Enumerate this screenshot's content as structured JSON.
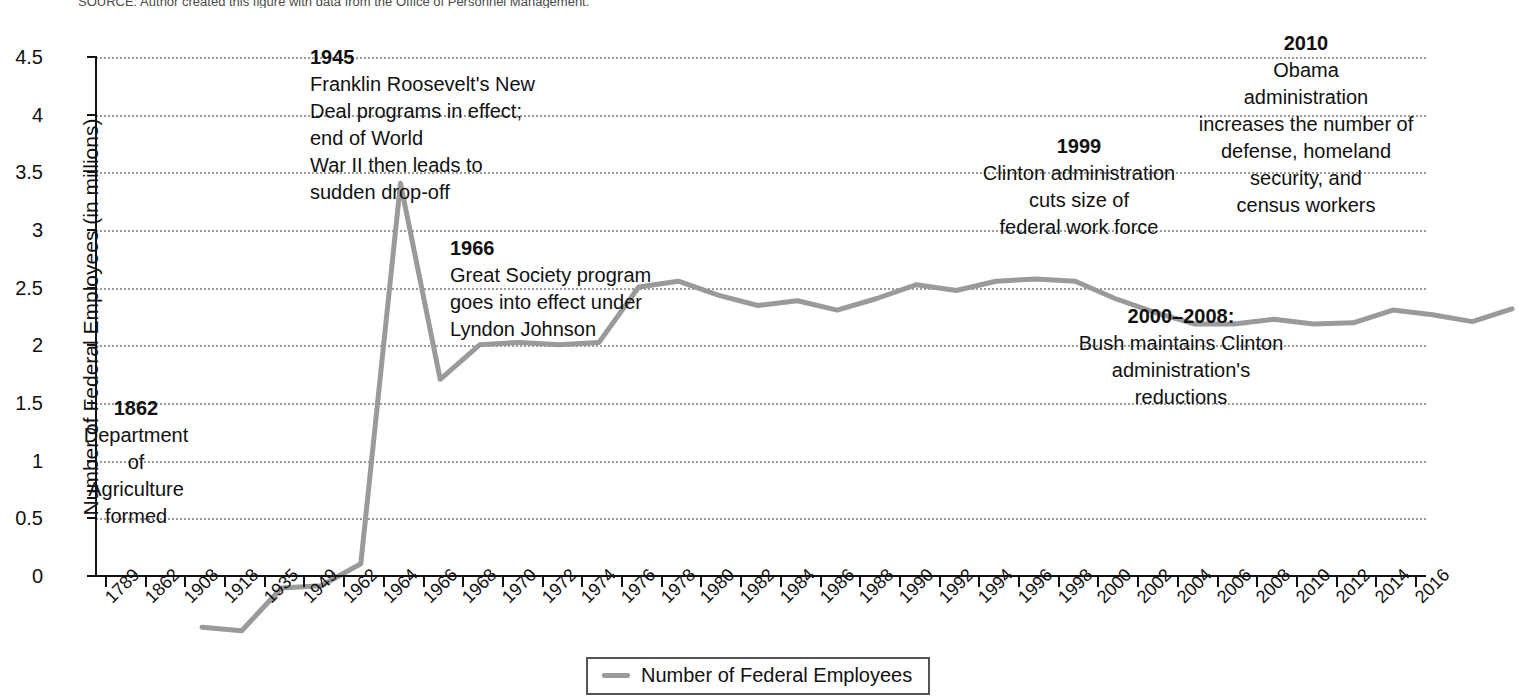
{
  "source_note": "SOURCE: Author created this figure with data from the Office of Personnel Management.",
  "legend": {
    "label": "Number of Federal Employees",
    "color": "#9a9a9a"
  },
  "annotations": [
    {
      "id": "anno-1862",
      "year": "1862",
      "lines": [
        "Department",
        "of",
        "Agriculture",
        "formed"
      ],
      "align": "center"
    },
    {
      "id": "anno-1945",
      "year": "1945",
      "lines": [
        "Franklin Roosevelt's New",
        "Deal programs in effect;",
        "end of World",
        "War II then leads to",
        "sudden drop-off"
      ],
      "align": "left"
    },
    {
      "id": "anno-1966",
      "year": "1966",
      "lines": [
        "Great Society program",
        "goes into effect under",
        "Lyndon Johnson"
      ],
      "align": "left"
    },
    {
      "id": "anno-1999",
      "year": "1999",
      "lines": [
        "Clinton administration",
        "cuts size of",
        "federal work force"
      ],
      "align": "center"
    },
    {
      "id": "anno-2000-2008",
      "year": "2000–2008:",
      "lines": [
        "Bush maintains Clinton",
        "administration's",
        "reductions"
      ],
      "align": "center"
    },
    {
      "id": "anno-2010",
      "year": "2010",
      "lines": [
        "Obama",
        "administration",
        "increases the number of",
        "defense, homeland",
        "security, and",
        "census workers"
      ],
      "align": "center"
    }
  ],
  "chart_data": {
    "type": "line",
    "title": "",
    "xlabel": "",
    "ylabel": "Number of Federal Employees (in millions)",
    "ylim": [
      0,
      4.5
    ],
    "ytick_labels": [
      "0",
      "0.5",
      "1",
      "1.5",
      "2",
      "2.5",
      "3",
      "3.5",
      "4",
      "4.5"
    ],
    "ytick_values": [
      0,
      0.5,
      1,
      1.5,
      2,
      2.5,
      3,
      3.5,
      4,
      4.5
    ],
    "grid": true,
    "legend_position": "bottom",
    "series": [
      {
        "name": "Number of Federal Employees",
        "color": "#9a9a9a",
        "categories": [
          "1789",
          "1862",
          "1908",
          "1918",
          "1935",
          "1949",
          "1962",
          "1964",
          "1966",
          "1968",
          "1970",
          "1972",
          "1974",
          "1976",
          "1978",
          "1980",
          "1982",
          "1984",
          "1986",
          "1988",
          "1990",
          "1992",
          "1994",
          "1996",
          "1998",
          "2000",
          "2002",
          "2004",
          "2006",
          "2008",
          "2010",
          "2012",
          "2014",
          "2016"
        ],
        "values": [
          0.05,
          0.02,
          0.39,
          0.41,
          0.6,
          3.9,
          2.2,
          2.5,
          2.52,
          2.5,
          2.52,
          3.0,
          3.05,
          2.93,
          2.84,
          2.88,
          2.8,
          2.9,
          3.02,
          2.97,
          3.05,
          3.07,
          3.05,
          2.9,
          2.78,
          2.68,
          2.68,
          2.72,
          2.68,
          2.69,
          2.8,
          2.76,
          2.7,
          2.81
        ]
      }
    ]
  }
}
